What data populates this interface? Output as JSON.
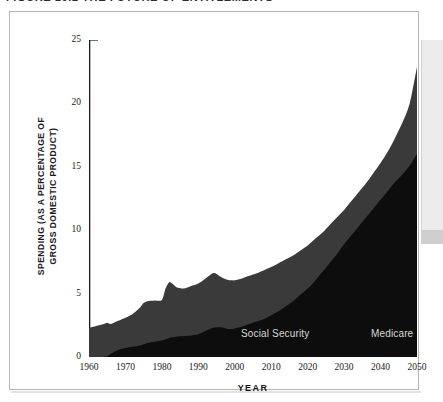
{
  "figure": {
    "cropped_caption": "FIGURE 10.2   THE FUTURE OF ENTITLEMENTS",
    "card_border_color": "#b5b5b5",
    "background_color": "#ffffff"
  },
  "chart_data": {
    "type": "area",
    "stacked": true,
    "title": "",
    "subtitle": "",
    "xlabel": "YEAR",
    "ylabel": "SPENDING (AS A PERCENTAGE OF GROSS DOMESTIC PRODUCT)",
    "ylabel_line1": "SPENDING (AS A PERCENTAGE OF",
    "ylabel_line2": "GROSS DOMESTIC PRODUCT)",
    "xlim": [
      1960,
      2050
    ],
    "ylim": [
      0,
      25
    ],
    "yticks": [
      0,
      5,
      10,
      15,
      20,
      25
    ],
    "ytick_labels": [
      "0",
      "5",
      "10",
      "15",
      "20",
      "25"
    ],
    "xticks": [
      1960,
      1970,
      1980,
      1990,
      2000,
      2010,
      2020,
      2030,
      2040,
      2050
    ],
    "xtick_labels": [
      "1960",
      "1970",
      "1980",
      "1990",
      "2000",
      "2010",
      "2020",
      "2030",
      "2040",
      "2050"
    ],
    "x_minor_tick_interval": 5,
    "grid": false,
    "legend_position": "inline-annotations",
    "annotations": [
      {
        "text": "Social Security",
        "x": 1988,
        "y": 4.1,
        "color": "#d8d8d8"
      },
      {
        "text": "Medicare",
        "x": 2023,
        "y": 4.1,
        "color": "#d8d8d8"
      }
    ],
    "x": [
      1960,
      1962,
      1964,
      1965,
      1966,
      1968,
      1970,
      1972,
      1974,
      1975,
      1976,
      1978,
      1980,
      1981,
      1982,
      1983,
      1984,
      1986,
      1988,
      1990,
      1992,
      1994,
      1995,
      1996,
      1997,
      1998,
      1999,
      2000,
      2002,
      2004,
      2006,
      2008,
      2010,
      2012,
      2014,
      2016,
      2018,
      2020,
      2022,
      2024,
      2026,
      2028,
      2030,
      2032,
      2034,
      2036,
      2038,
      2040,
      2042,
      2044,
      2046,
      2048,
      2050
    ],
    "series": [
      {
        "name": "Medicare",
        "color": "#0d0d0d",
        "values": [
          0.0,
          0.0,
          0.0,
          0.05,
          0.25,
          0.55,
          0.7,
          0.8,
          0.9,
          1.0,
          1.1,
          1.2,
          1.3,
          1.4,
          1.5,
          1.55,
          1.6,
          1.65,
          1.7,
          1.8,
          2.05,
          2.3,
          2.35,
          2.35,
          2.3,
          2.2,
          2.2,
          2.25,
          2.4,
          2.6,
          2.8,
          3.0,
          3.3,
          3.6,
          4.0,
          4.4,
          4.9,
          5.4,
          6.0,
          6.7,
          7.4,
          8.1,
          8.9,
          9.6,
          10.3,
          11.0,
          11.7,
          12.4,
          13.1,
          13.8,
          14.4,
          15.1,
          16.0
        ]
      },
      {
        "name": "Social Security",
        "color": "#3a3a3a",
        "values": [
          2.3,
          2.45,
          2.6,
          2.7,
          2.6,
          2.85,
          3.1,
          3.4,
          3.9,
          4.25,
          4.4,
          4.45,
          4.5,
          5.4,
          5.9,
          5.75,
          5.5,
          5.4,
          5.6,
          5.8,
          6.2,
          6.6,
          6.55,
          6.35,
          6.2,
          6.1,
          6.05,
          6.05,
          6.2,
          6.4,
          6.6,
          6.85,
          7.1,
          7.4,
          7.7,
          8.0,
          8.4,
          8.8,
          9.3,
          9.8,
          10.4,
          11.0,
          11.6,
          12.3,
          13.0,
          13.7,
          14.5,
          15.3,
          16.2,
          17.3,
          18.5,
          20.0,
          22.9
        ]
      }
    ]
  }
}
